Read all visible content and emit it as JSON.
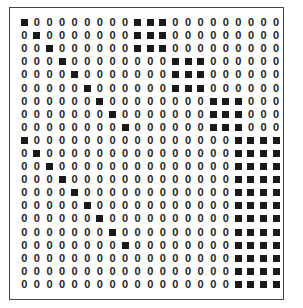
{
  "figure": {
    "zero_symbol": "0",
    "filled_color": "#1a1a1a",
    "rows": 21,
    "cols": 21,
    "filled": [
      [
        0,
        9,
        10,
        11
      ],
      [
        1,
        9,
        10,
        11
      ],
      [
        2,
        9,
        10,
        11
      ],
      [
        3,
        12,
        13,
        14
      ],
      [
        4,
        12,
        13,
        14
      ],
      [
        5,
        12,
        13,
        14
      ],
      [
        6,
        15,
        16,
        17
      ],
      [
        7,
        15,
        16,
        17
      ],
      [
        8,
        15,
        16,
        17
      ],
      [
        0,
        17,
        18,
        19,
        20
      ],
      [
        1,
        17,
        18,
        19,
        20
      ],
      [
        2,
        17,
        18,
        19,
        20
      ],
      [
        3,
        17,
        18,
        19,
        20
      ],
      [
        4,
        17,
        18,
        19,
        20
      ],
      [
        5,
        17,
        18,
        19,
        20
      ],
      [
        6,
        17,
        18,
        19,
        20
      ],
      [
        7,
        17,
        18,
        19,
        20
      ],
      [
        8,
        17,
        18,
        19,
        20
      ],
      [
        17,
        18,
        19,
        20
      ],
      [
        17,
        18,
        19,
        20
      ],
      [
        17,
        18,
        19,
        20
      ]
    ]
  }
}
